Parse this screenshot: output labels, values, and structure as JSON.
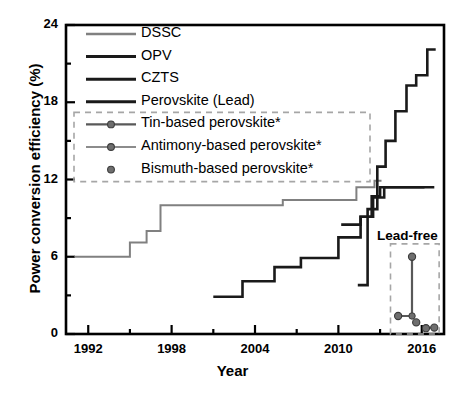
{
  "chart_data": {
    "type": "line",
    "title": "",
    "xlabel": "Year",
    "ylabel": "Power conversion efficiency (%)",
    "xlim": [
      1990.4,
      2017.6
    ],
    "ylim": [
      0,
      24
    ],
    "xticks": [
      1992,
      1998,
      2004,
      2010,
      2016
    ],
    "xtick_labels": [
      "1992",
      "1998",
      "2004",
      "2010",
      "2016"
    ],
    "x_minor_ticks": [
      1995,
      2001,
      2007,
      2013
    ],
    "yticks": [
      0,
      6,
      12,
      18,
      24
    ],
    "ytick_labels": [
      "0",
      "6",
      "12",
      "18",
      "24"
    ],
    "y_minor_ticks": [
      3,
      9,
      15,
      21
    ],
    "grid": false,
    "legend_position": "upper-left",
    "series": [
      {
        "name": "DSSC",
        "label": "DSSC",
        "color": "#808080",
        "style": "step",
        "linewidth": 2.0,
        "points": [
          [
            1991.0,
            6.0
          ],
          [
            1995.0,
            6.0
          ],
          [
            1995.0,
            7.1
          ],
          [
            1996.2,
            7.1
          ],
          [
            1996.2,
            8.0
          ],
          [
            1997.2,
            8.0
          ],
          [
            1997.2,
            10.0
          ],
          [
            2006.0,
            10.0
          ],
          [
            2006.0,
            10.4
          ],
          [
            2011.3,
            10.4
          ],
          [
            2011.3,
            11.4
          ],
          [
            2012.6,
            11.4
          ],
          [
            2012.6,
            11.9
          ],
          [
            2013.1,
            11.9
          ]
        ]
      },
      {
        "name": "OPV",
        "label": "OPV",
        "color": "#1a1a1a",
        "style": "step",
        "linewidth": 2.6,
        "points": [
          [
            2001.0,
            2.9
          ],
          [
            2003.1,
            2.9
          ],
          [
            2003.1,
            4.1
          ],
          [
            2005.4,
            4.1
          ],
          [
            2005.4,
            5.2
          ],
          [
            2007.3,
            5.2
          ],
          [
            2007.3,
            5.9
          ],
          [
            2010.0,
            5.9
          ],
          [
            2010.0,
            7.5
          ],
          [
            2011.6,
            7.5
          ],
          [
            2011.6,
            9.1
          ],
          [
            2012.5,
            9.1
          ],
          [
            2012.5,
            10.6
          ],
          [
            2013.3,
            10.6
          ],
          [
            2013.3,
            11.4
          ],
          [
            2016.9,
            11.4
          ]
        ]
      },
      {
        "name": "CZTS",
        "label": "CZTS",
        "color": "#1a1a1a",
        "style": "step",
        "linewidth": 2.6,
        "points": [
          [
            2010.2,
            8.5
          ],
          [
            2011.6,
            8.5
          ],
          [
            2011.6,
            9.1
          ],
          [
            2012.4,
            9.1
          ],
          [
            2012.4,
            10.7
          ],
          [
            2013.0,
            10.7
          ],
          [
            2013.0,
            11.4
          ],
          [
            2016.2,
            11.4
          ]
        ]
      },
      {
        "name": "Perovskite (Lead)",
        "label": "Perovskite (Lead)",
        "color": "#1a1a1a",
        "style": "step",
        "linewidth": 2.6,
        "points": [
          [
            2011.4,
            3.8
          ],
          [
            2012.1,
            3.8
          ],
          [
            2012.1,
            9.7
          ],
          [
            2012.8,
            9.7
          ],
          [
            2012.8,
            13.0
          ],
          [
            2013.4,
            13.0
          ],
          [
            2013.4,
            15.0
          ],
          [
            2014.1,
            15.0
          ],
          [
            2014.1,
            17.3
          ],
          [
            2014.9,
            17.3
          ],
          [
            2014.9,
            19.3
          ],
          [
            2015.6,
            19.3
          ],
          [
            2015.6,
            20.1
          ],
          [
            2016.4,
            20.1
          ],
          [
            2016.4,
            22.1
          ],
          [
            2017.0,
            22.1
          ]
        ]
      },
      {
        "name": "Tin-based perovskite*",
        "label": "Tin-based perovskite*",
        "color": "#595959",
        "style": "line-marker",
        "linewidth": 2.2,
        "points": [
          [
            2014.3,
            1.4
          ],
          [
            2015.3,
            1.4
          ],
          [
            2015.3,
            6.0
          ]
        ]
      },
      {
        "name": "Antimony-based perovskite*",
        "label": "Antimony-based perovskite*",
        "color": "#8c8c8c",
        "style": "line-marker",
        "linewidth": 2.0,
        "points": [
          [
            2016.3,
            0.45
          ],
          [
            2016.9,
            0.5
          ]
        ]
      },
      {
        "name": "Bismuth-based perovskite*",
        "label": "Bismuth-based perovskite*",
        "color": "#595959",
        "style": "marker-only",
        "linewidth": 0,
        "points": [
          [
            2015.6,
            0.9
          ]
        ]
      }
    ],
    "annotations": [
      {
        "name": "lead-free-label",
        "text": "Lead-free",
        "x": 2014.2,
        "y": 7.6
      }
    ]
  },
  "legend": {
    "entries": [
      {
        "label": "DSSC",
        "color": "#808080",
        "kind": "line",
        "in_dashed_box": false
      },
      {
        "label": "OPV",
        "color": "#1a1a1a",
        "kind": "line",
        "in_dashed_box": false
      },
      {
        "label": "CZTS",
        "color": "#1a1a1a",
        "kind": "line",
        "in_dashed_box": false
      },
      {
        "label": "Perovskite (Lead)",
        "color": "#1a1a1a",
        "kind": "line",
        "in_dashed_box": false
      },
      {
        "label": "Tin-based perovskite*",
        "color": "#595959",
        "kind": "line-marker",
        "in_dashed_box": true
      },
      {
        "label": "Antimony-based perovskite*",
        "color": "#8c8c8c",
        "kind": "line-marker",
        "in_dashed_box": true
      },
      {
        "label": "Bismuth-based perovskite*",
        "color": "#595959",
        "kind": "marker",
        "in_dashed_box": true
      }
    ]
  },
  "colors": {
    "axis": "#000000",
    "dssc": "#808080",
    "dark": "#1a1a1a",
    "marker_fill": "#6e6e6e",
    "dashed_box": "#a6a6a6",
    "background": "#ffffff"
  }
}
